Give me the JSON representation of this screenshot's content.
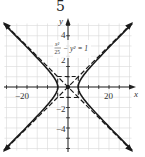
{
  "problem_number": "5",
  "chart_data": {
    "type": "line",
    "title": "",
    "equation_label": "x²/25 − y² = 1",
    "equation_numerator": "x²",
    "equation_denominator": "25",
    "equation_rest": "− y² = 1",
    "xlabel": "x",
    "ylabel": "y",
    "x_ticks_labeled": [
      "−20",
      "20"
    ],
    "y_ticks_labeled": [
      "4",
      "2",
      "−2",
      "−4"
    ],
    "xlim": [
      -30,
      30
    ],
    "ylim": [
      -6,
      6
    ],
    "grid": true,
    "series": [
      {
        "name": "hyperbola",
        "style": "solid",
        "equation": "x^2/25 - y^2 = 1",
        "vertices": [
          [
            -5,
            0
          ],
          [
            5,
            0
          ]
        ]
      },
      {
        "name": "asymptote-positive",
        "style": "dashed",
        "equation": "y = x/5"
      },
      {
        "name": "asymptote-negative",
        "style": "dashed",
        "equation": "y = -x/5"
      },
      {
        "name": "fundamental-rectangle",
        "style": "dashed",
        "corners": [
          [
            -5,
            1
          ],
          [
            5,
            1
          ],
          [
            5,
            -1
          ],
          [
            -5,
            -1
          ]
        ]
      }
    ],
    "center": [
      0,
      0
    ]
  },
  "colors": {
    "curve": "#1a1a1a",
    "grid": "#d8d8d8",
    "axis": "#222222"
  }
}
